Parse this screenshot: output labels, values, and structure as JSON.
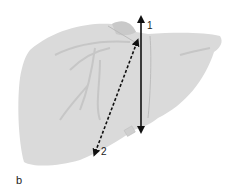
{
  "figure": {
    "panel_label": "b",
    "arrows": [
      {
        "id": "1",
        "label": "1",
        "style": "solid",
        "description": "vertical double-headed arrow"
      },
      {
        "id": "2",
        "label": "2",
        "style": "dashed",
        "description": "diagonal double-headed arrow"
      }
    ],
    "colors": {
      "organ_fill": "#d9d9d9",
      "organ_vessel": "#c4c4c4",
      "arrow": "#111111"
    }
  }
}
